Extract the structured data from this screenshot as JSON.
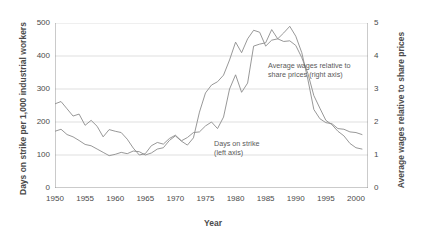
{
  "chart_data": {
    "type": "line",
    "title": "",
    "xlabel": "Year",
    "ylabel_left": "Days on strike per 1,000 industrial workers",
    "ylabel_right": "Average wages relative to share prices",
    "xlim": [
      1950,
      2002
    ],
    "ylim_left": [
      0,
      500
    ],
    "ylim_right": [
      0,
      5
    ],
    "xticks": [
      "1950",
      "1955",
      "1960",
      "1965",
      "1970",
      "1975",
      "1980",
      "1985",
      "1990",
      "1995",
      "2000"
    ],
    "xtick_values": [
      1950,
      1955,
      1960,
      1965,
      1970,
      1975,
      1980,
      1985,
      1990,
      1995,
      2000
    ],
    "yticks_left": [
      "0",
      "100",
      "200",
      "300",
      "400",
      "500"
    ],
    "ytick_values_left": [
      0,
      100,
      200,
      300,
      400,
      500
    ],
    "yticks_right": [
      "0",
      "1",
      "2",
      "3",
      "4",
      "5"
    ],
    "ytick_values_right": [
      0,
      1,
      2,
      3,
      4,
      5
    ],
    "grid": "horizontal",
    "legend_position": "inline-annotations",
    "line_color": "#8c8c8c",
    "grid_color": "#c9c9c9",
    "axis_color": "#8a8a8a",
    "annotations": [
      {
        "id": "wages-annotation",
        "text_line1": "Average wages relative to",
        "text_line2": "share prices (right axis)",
        "x_px": 268,
        "y_px": 61
      },
      {
        "id": "strike-annotation",
        "text_line1": "Days on strike",
        "text_line2": "(left axis)",
        "x_px": 214,
        "y_px": 139
      }
    ],
    "series": [
      {
        "name": "Days on strike",
        "axis": "left",
        "x": [
          1950,
          1951,
          1952,
          1953,
          1954,
          1955,
          1956,
          1957,
          1958,
          1959,
          1960,
          1961,
          1962,
          1963,
          1964,
          1965,
          1966,
          1967,
          1968,
          1969,
          1970,
          1971,
          1972,
          1973,
          1974,
          1975,
          1976,
          1977,
          1978,
          1979,
          1980,
          1981,
          1982,
          1983,
          1984,
          1985,
          1986,
          1987,
          1988,
          1989,
          1990,
          1991,
          1992,
          1993,
          1994,
          1995,
          1996,
          1997,
          1998,
          1999,
          2000,
          2001
        ],
        "y": [
          255,
          262,
          240,
          218,
          224,
          190,
          205,
          187,
          155,
          177,
          172,
          168,
          148,
          121,
          100,
          104,
          128,
          138,
          133,
          150,
          160,
          143,
          153,
          168,
          170,
          188,
          200,
          180,
          215,
          300,
          343,
          290,
          318,
          430,
          436,
          440,
          480,
          452,
          470,
          490,
          460,
          410,
          330,
          238,
          210,
          198,
          195,
          180,
          178,
          170,
          168,
          162
        ]
      },
      {
        "name": "Average wages relative to share prices",
        "axis": "right",
        "x": [
          1950,
          1951,
          1952,
          1953,
          1954,
          1955,
          1956,
          1957,
          1958,
          1959,
          1960,
          1961,
          1962,
          1963,
          1964,
          1965,
          1966,
          1967,
          1968,
          1969,
          1970,
          1971,
          1972,
          1973,
          1974,
          1975,
          1976,
          1977,
          1978,
          1979,
          1980,
          1981,
          1982,
          1983,
          1984,
          1985,
          1986,
          1987,
          1988,
          1989,
          1990,
          1991,
          1992,
          1993,
          1994,
          1995,
          1996,
          1997,
          1998,
          1999,
          2000,
          2001
        ],
        "y": [
          1.72,
          1.78,
          1.62,
          1.55,
          1.44,
          1.32,
          1.28,
          1.18,
          1.08,
          0.98,
          1.02,
          1.08,
          1.04,
          1.12,
          1.1,
          1.0,
          1.06,
          1.18,
          1.22,
          1.44,
          1.58,
          1.42,
          1.3,
          1.52,
          2.3,
          2.88,
          3.12,
          3.22,
          3.42,
          3.88,
          4.42,
          4.1,
          4.52,
          4.78,
          4.72,
          4.3,
          4.48,
          4.52,
          4.44,
          4.46,
          4.32,
          3.95,
          3.48,
          2.8,
          2.42,
          2.05,
          1.92,
          1.72,
          1.58,
          1.35,
          1.22,
          1.18
        ]
      }
    ]
  }
}
